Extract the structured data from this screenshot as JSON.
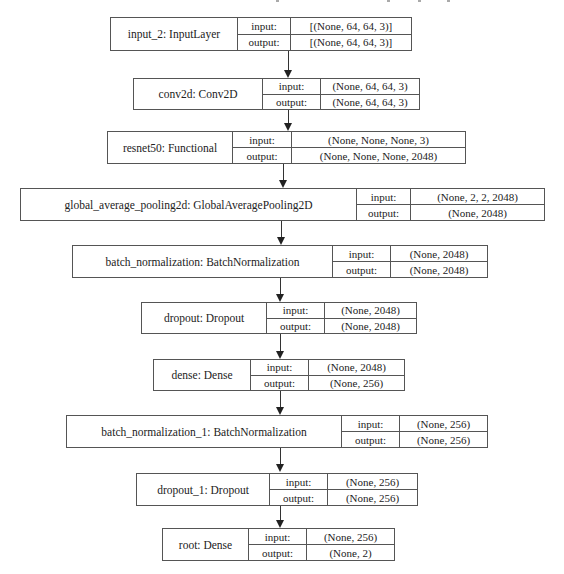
{
  "diagram": {
    "type": "keras-model-plot",
    "io_labels": {
      "input": "input:",
      "output": "output:"
    },
    "layers": [
      {
        "name": "input_2: InputLayer",
        "input": "[(None, 64, 64, 3)]",
        "output": "[(None, 64, 64, 3)]"
      },
      {
        "name": "conv2d: Conv2D",
        "input": "(None, 64, 64, 3)",
        "output": "(None, 64, 64, 3)"
      },
      {
        "name": "resnet50: Functional",
        "input": "(None, None, None, 3)",
        "output": "(None, None, None, 2048)"
      },
      {
        "name": "global_average_pooling2d: GlobalAveragePooling2D",
        "input": "(None, 2, 2, 2048)",
        "output": "(None, 2048)"
      },
      {
        "name": "batch_normalization: BatchNormalization",
        "input": "(None, 2048)",
        "output": "(None, 2048)"
      },
      {
        "name": "dropout: Dropout",
        "input": "(None, 2048)",
        "output": "(None, 2048)"
      },
      {
        "name": "dense: Dense",
        "input": "(None, 2048)",
        "output": "(None, 256)"
      },
      {
        "name": "batch_normalization_1: BatchNormalization",
        "input": "(None, 256)",
        "output": "(None, 256)"
      },
      {
        "name": "dropout_1: Dropout",
        "input": "(None, 256)",
        "output": "(None, 256)"
      },
      {
        "name": "root: Dense",
        "input": "(None, 256)",
        "output": "(None, 2)"
      }
    ],
    "edges": [
      [
        "input_2",
        "conv2d"
      ],
      [
        "conv2d",
        "resnet50"
      ],
      [
        "resnet50",
        "global_average_pooling2d"
      ],
      [
        "global_average_pooling2d",
        "batch_normalization"
      ],
      [
        "batch_normalization",
        "dropout"
      ],
      [
        "dropout",
        "dense"
      ],
      [
        "dense",
        "batch_normalization_1"
      ],
      [
        "batch_normalization_1",
        "dropout_1"
      ],
      [
        "dropout_1",
        "root"
      ]
    ],
    "colors": {
      "border": "#555555",
      "text": "#222222",
      "background": "#ffffff",
      "arrow": "#222222"
    }
  }
}
